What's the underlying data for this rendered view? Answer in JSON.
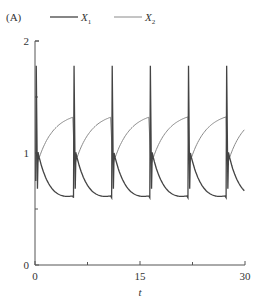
{
  "panel_label": "(A)",
  "legend": [
    {
      "name": "X",
      "sub": "1",
      "color": "#444444",
      "width": 1.3
    },
    {
      "name": "X",
      "sub": "2",
      "color": "#8a8a8a",
      "width": 1.0
    }
  ],
  "axes": {
    "xlabel": "t",
    "xticks": [
      0,
      15,
      30
    ],
    "xminor": [
      7.5,
      22.5
    ],
    "yticks": [
      0,
      1,
      2
    ],
    "yminor": [
      0.5,
      1.5
    ]
  },
  "chart_data": {
    "type": "line",
    "title": "(A)",
    "xlabel": "t",
    "ylabel": "",
    "xlim": [
      0,
      30
    ],
    "ylim": [
      0,
      2
    ],
    "grid": false,
    "legend_position": "top",
    "period": 5.45,
    "spike_times": [
      0.1,
      5.5,
      10.95,
      16.4,
      21.85,
      27.3
    ],
    "series": [
      {
        "name": "X1",
        "description": "relaxation oscillation: spike to ~1.78, drop to ~0.68, jump to ~1.0 then decay to ~0.6",
        "peak": 1.78,
        "post_spike_low": 0.68,
        "restart": 1.0,
        "minimum": 0.6
      },
      {
        "name": "X2",
        "description": "slow rise from ~0.9 to ~1.32 then sharp drop at each spike",
        "start": 0.9,
        "max": 1.32
      }
    ]
  }
}
